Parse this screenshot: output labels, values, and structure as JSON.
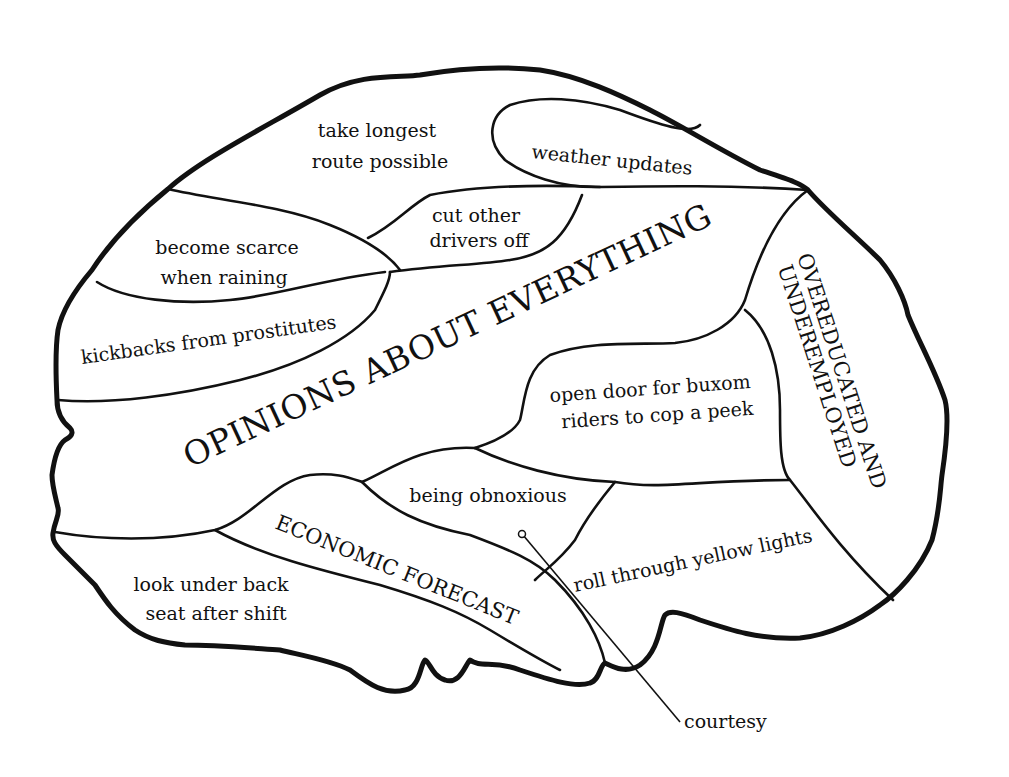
{
  "diagram": {
    "type": "annotated-brain-map",
    "regions": [
      {
        "id": "top-front",
        "lines": [
          "take longest",
          "route possible"
        ]
      },
      {
        "id": "top-right",
        "lines": [
          "weather updates"
        ]
      },
      {
        "id": "upper-left",
        "lines": [
          "become scarce",
          "when raining"
        ]
      },
      {
        "id": "upper-mid",
        "lines": [
          "cut other",
          "drivers off"
        ]
      },
      {
        "id": "left",
        "lines": [
          "kickbacks from prostitutes"
        ]
      },
      {
        "id": "center",
        "lines": [
          "OPINIONS ABOUT EVERYTHING"
        ]
      },
      {
        "id": "right-vertical",
        "lines": [
          "OVEREDUCATED AND",
          "UNDEREMPLOYED"
        ]
      },
      {
        "id": "mid-right",
        "lines": [
          "open door for buxom",
          "riders to cop a peek"
        ]
      },
      {
        "id": "mid-lower",
        "lines": [
          "being obnoxious"
        ]
      },
      {
        "id": "diagonal-band",
        "lines": [
          "ECONOMIC FORECAST"
        ]
      },
      {
        "id": "lower-right",
        "lines": [
          "roll through yellow lights"
        ]
      },
      {
        "id": "bottom-left",
        "lines": [
          "look under back",
          "seat after shift"
        ]
      }
    ],
    "callout": {
      "label": "courtesy"
    },
    "colors": {
      "ink": "#111111",
      "paper": "#ffffff"
    }
  }
}
